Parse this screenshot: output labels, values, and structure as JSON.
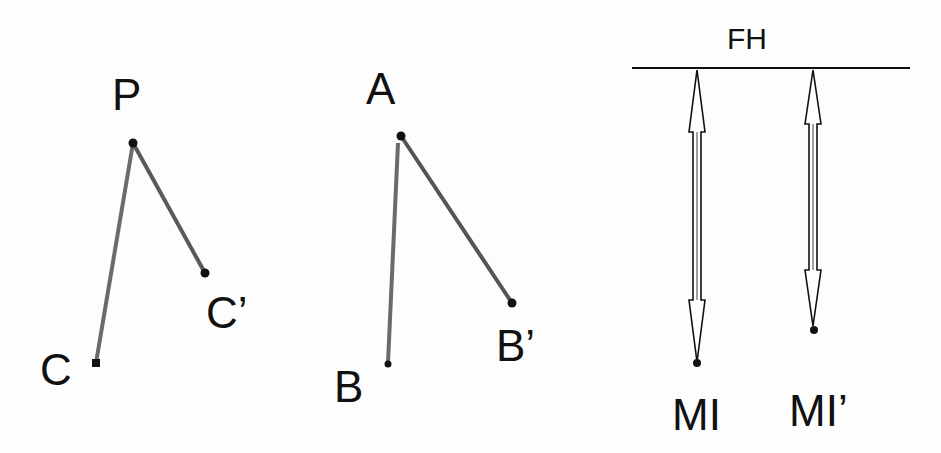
{
  "diagram": {
    "colors": {
      "background": "#fdfdfd",
      "line": "#6a6a6a",
      "point": "#111111",
      "text": "#111111"
    },
    "panel_left": {
      "labels": {
        "vertex": "P",
        "end1": "C",
        "end2": "C’"
      },
      "points": {
        "P": [
          133,
          143
        ],
        "C": [
          96,
          363
        ],
        "C_prime": [
          205,
          273
        ]
      }
    },
    "panel_middle": {
      "labels": {
        "vertex": "A",
        "end1": "B",
        "end2": "B’"
      },
      "points": {
        "A": [
          401,
          136
        ],
        "B": [
          388,
          363
        ],
        "B_prime": [
          512,
          303
        ]
      }
    },
    "panel_right": {
      "reference_line_label": "FH",
      "reference_line": {
        "x1": 632,
        "x2": 910,
        "y": 68
      },
      "arrows": [
        {
          "label": "MI",
          "x": 697,
          "top": 68,
          "bottom": 363
        },
        {
          "label": "MI’",
          "x": 813,
          "top": 68,
          "bottom": 330
        }
      ]
    }
  }
}
